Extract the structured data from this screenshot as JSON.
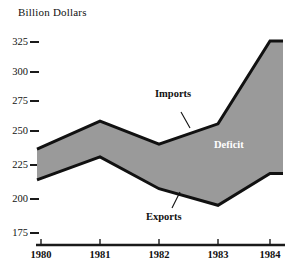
{
  "chart_data": {
    "type": "area",
    "title": "Billion Dollars",
    "xlabel": "",
    "ylabel": "Billion Dollars",
    "categories": [
      "1980",
      "1981",
      "1982",
      "1983",
      "1984"
    ],
    "x": [
      1980,
      1981,
      1982,
      1983,
      1984
    ],
    "series": [
      {
        "name": "Imports",
        "values": [
          240,
          262,
          244,
          260,
          325
        ]
      },
      {
        "name": "Exports",
        "values": [
          216,
          234,
          209,
          196,
          221
        ]
      }
    ],
    "shaded_region": {
      "name": "Deficit",
      "fill": "#9a9a9a"
    },
    "ylim": [
      175,
      330
    ],
    "yticks": [
      175,
      200,
      225,
      250,
      275,
      300,
      325
    ],
    "ytick_labels": [
      "175",
      "200",
      "225",
      "250",
      "275",
      "300",
      "325"
    ],
    "xticks": [
      1980,
      1981,
      1982,
      1983,
      1984
    ],
    "grid": false,
    "legend": "inline-annotations",
    "annotations": [
      {
        "text": "Imports",
        "target_series": "Imports",
        "leader": true
      },
      {
        "text": "Exports",
        "target_series": "Exports",
        "leader": true
      },
      {
        "text": "Deficit",
        "target_series": "shaded_region",
        "leader": false
      }
    ]
  },
  "colors": {
    "fill": "#9a9a9a",
    "line": "#111111",
    "axis": "#1a1a1a",
    "deficit_text": "#ffffff",
    "background": "#ffffff"
  },
  "axis": {
    "title": "Billion Dollars",
    "y_labels": [
      "325",
      "300",
      "275",
      "250",
      "225",
      "200",
      "175"
    ],
    "x_labels": [
      "1980",
      "1981",
      "1982",
      "1983",
      "1984"
    ]
  },
  "labels": {
    "imports": "Imports",
    "exports": "Exports",
    "deficit": "Deficit"
  }
}
